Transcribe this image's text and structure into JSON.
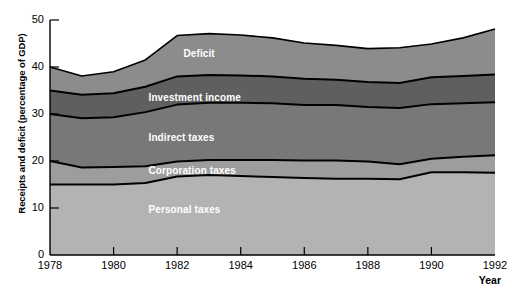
{
  "chart_data": {
    "type": "area",
    "title": "",
    "xlabel": "Year",
    "ylabel": "Receipts and deficit (percentage of GDP)",
    "stacked": true,
    "grid": false,
    "legend_position": "inline-band-labels",
    "xlim": [
      1978,
      1992
    ],
    "ylim": [
      0,
      50
    ],
    "x_ticks": [
      1978,
      1980,
      1982,
      1984,
      1986,
      1988,
      1990,
      1992
    ],
    "x_tick_labels": [
      "1978",
      "1980",
      "1982",
      "1984",
      "1986",
      "1988",
      "1990",
      "1992"
    ],
    "y_ticks": [
      0,
      10,
      20,
      30,
      40,
      50
    ],
    "y_tick_labels": [
      "0",
      "10",
      "20",
      "30",
      "40",
      "50"
    ],
    "x": [
      1978,
      1979,
      1980,
      1981,
      1982,
      1983,
      1984,
      1985,
      1986,
      1987,
      1988,
      1989,
      1990,
      1991,
      1992
    ],
    "series": [
      {
        "name": "Personal taxes",
        "color": "#b3b3b3",
        "label_x": 1981.1,
        "label_y": 9.5,
        "values": [
          15.0,
          15.0,
          15.0,
          15.3,
          16.7,
          17.0,
          16.8,
          16.6,
          16.4,
          16.2,
          16.2,
          16.1,
          17.6,
          17.6,
          17.5
        ]
      },
      {
        "name": "Corporation taxes",
        "color": "#9d9d9d",
        "label_x": 1981.1,
        "label_y": 17.9,
        "values": [
          5.0,
          3.6,
          3.7,
          3.6,
          3.2,
          3.2,
          3.4,
          3.6,
          3.7,
          3.9,
          3.7,
          3.2,
          2.9,
          3.3,
          3.7
        ]
      },
      {
        "name": "Indirect taxes",
        "color": "#787878",
        "label_x": 1981.1,
        "label_y": 24.8,
        "values": [
          10.0,
          10.5,
          10.6,
          11.5,
          12.1,
          12.2,
          12.2,
          12.1,
          11.8,
          11.8,
          11.6,
          12.0,
          11.6,
          11.4,
          11.3
        ]
      },
      {
        "name": "Investment income",
        "color": "#5f5f5f",
        "label_x": 1981.1,
        "label_y": 33.4,
        "values": [
          5.0,
          5.0,
          5.1,
          5.4,
          6.0,
          5.9,
          5.8,
          5.7,
          5.6,
          5.4,
          5.3,
          5.3,
          5.7,
          5.8,
          5.9
        ]
      },
      {
        "name": "Deficit",
        "color": "#8c8c8c",
        "label_x": 1982.2,
        "label_y": 42.8,
        "values": [
          5.0,
          4.0,
          4.6,
          5.7,
          8.7,
          8.8,
          8.6,
          8.2,
          7.6,
          7.3,
          7.1,
          7.5,
          7.1,
          8.1,
          9.7
        ]
      }
    ],
    "totals": [
      40.0,
      38.1,
      39.0,
      41.5,
      46.7,
      47.1,
      46.8,
      46.2,
      45.1,
      44.6,
      43.9,
      44.1,
      44.9,
      46.2,
      48.1
    ]
  },
  "axis": {
    "y_title": "Receipts and deficit (percentage of GDP)",
    "x_title": "Year"
  },
  "colors": {
    "personal_taxes": "#b3b3b3",
    "corporation_taxes": "#9d9d9d",
    "indirect_taxes": "#787878",
    "investment_income": "#5f5f5f",
    "deficit": "#8c8c8c",
    "outline": "#000000",
    "background": "#ffffff"
  }
}
